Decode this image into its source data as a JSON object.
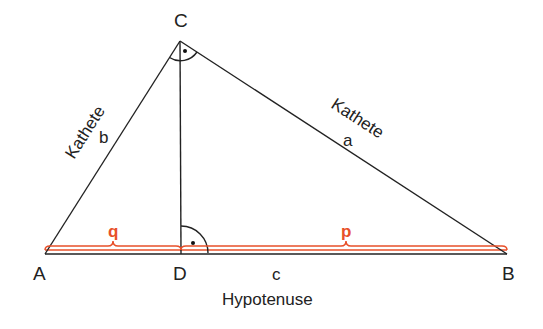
{
  "diagram": {
    "vertices": {
      "A": "A",
      "B": "B",
      "C": "C",
      "D": "D"
    },
    "sides": {
      "a": "a",
      "b": "b",
      "c": "c"
    },
    "leg_label": "Kathete",
    "hypotenuse_label": "Hypotenuse",
    "segments": {
      "q": "q",
      "p": "p"
    },
    "colors": {
      "line": "#222222",
      "accent": "#e8502a"
    },
    "right_angle_marks": [
      "C",
      "D"
    ]
  }
}
